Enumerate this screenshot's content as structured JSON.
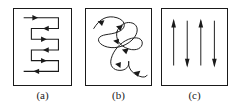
{
  "figure": {
    "background_color": "#ffffff",
    "stroke_color": "#1a1a1a",
    "panel_count": 3
  },
  "panels": [
    {
      "id": "panel-a",
      "caption": "(a)",
      "pattern_name": "rectilinear-boustrophedon-path",
      "description": "Rectilinear serpentine (boustrophedon) sweep path with direction arrowheads",
      "arrow_count": 6,
      "row_directions": [
        "right",
        "left",
        "right",
        "left",
        "right",
        "left"
      ]
    },
    {
      "id": "panel-b",
      "caption": "(b)",
      "pattern_name": "smooth-looping-zigzag-path",
      "description": "Hand-drawn smooth looping sinusoidal sweep path with direction arrowheads",
      "arrow_count": 6
    },
    {
      "id": "panel-c",
      "caption": "(c)",
      "pattern_name": "alternating-vertical-arrows",
      "description": "Four vertical arrows with alternating up and down directions",
      "arrow_count": 4,
      "arrow_directions": [
        "up",
        "down",
        "up",
        "down"
      ]
    }
  ]
}
